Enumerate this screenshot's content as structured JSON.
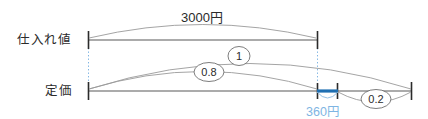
{
  "diagram": {
    "type": "line-segment-diagram",
    "title_text": "",
    "rows": [
      {
        "key": "cost_price",
        "label": "仕入れ値"
      },
      {
        "key": "list_price",
        "label": "定価"
      }
    ],
    "labels": {
      "total_amount": "3000円",
      "difference_amount": "360円"
    },
    "ratio_badges": [
      {
        "key": "one",
        "value": "1"
      },
      {
        "key": "point8",
        "value": "0.8"
      },
      {
        "key": "point2",
        "value": "0.2"
      }
    ],
    "colors": {
      "highlight_blue": "#1f6fb2",
      "light_blue": "#7fb5e3",
      "axis_gray": "#595959",
      "arc_gray": "#9a9a9a",
      "text_dark": "#2b2b2b"
    }
  }
}
